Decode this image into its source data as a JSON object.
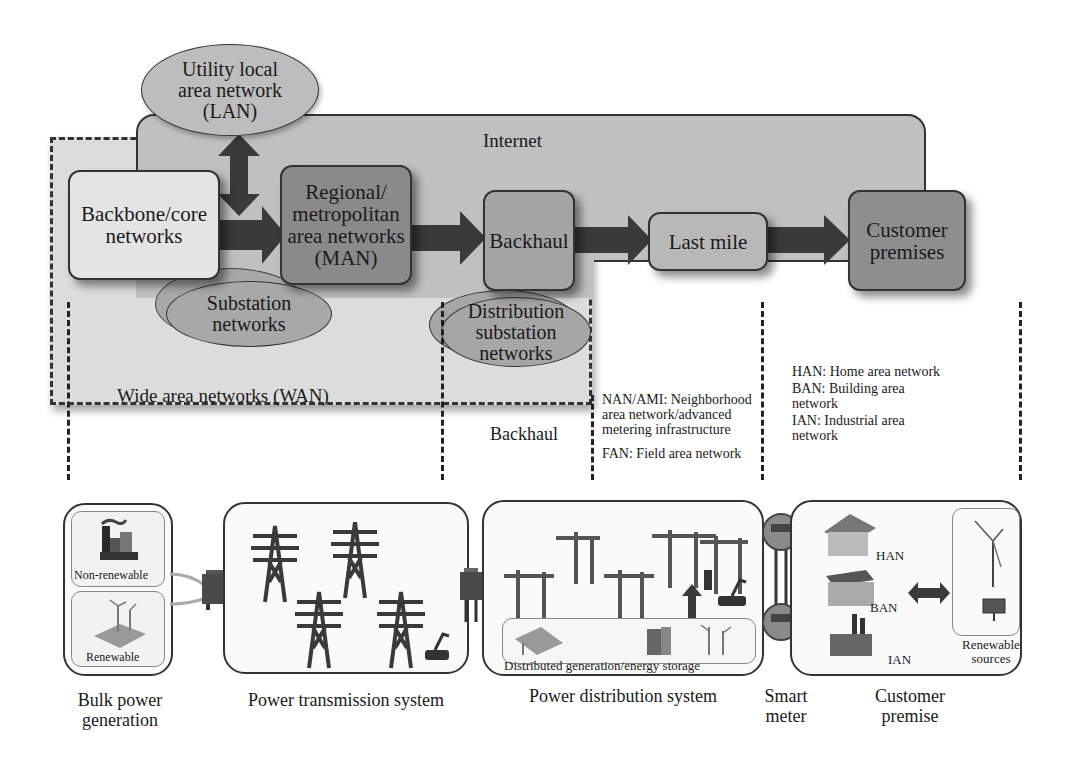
{
  "top": {
    "internet_label": "Internet",
    "wan_label": "Wide area networks (WAN)",
    "nodes": {
      "backbone": "Backbone/core networks",
      "man": "Regional/ metropolitan area networks (MAN)",
      "backhaul": "Backhaul",
      "last_mile": "Last mile",
      "customer": "Customer premises"
    },
    "ellipses": {
      "lan": "Utility local area network (LAN)",
      "substation": "Substation networks",
      "distribution": "Distribution substation networks"
    }
  },
  "middle": {
    "backhaul_label": "Backhaul",
    "nan_notes": [
      "NAN/AMI: Neighborhood area network/advanced metering infrastructure",
      "FAN: Field area network"
    ],
    "han_notes": [
      "HAN: Home area network",
      "BAN: Building area network",
      "IAN: Industrial area network"
    ]
  },
  "bottom": {
    "bulk": {
      "caption": "Bulk power generation",
      "non_renewable": "Non-renewable",
      "renewable": "Renewable"
    },
    "transmission": {
      "caption": "Power transmission system"
    },
    "distribution": {
      "caption": "Power distribution system",
      "storage_label": "Distributed generation/energy storage"
    },
    "smart_meter": {
      "caption": "Smart meter"
    },
    "customer": {
      "caption": "Customer premise",
      "han": "HAN",
      "ban": "BAN",
      "ian": "IAN",
      "renewable_sources": "Renewable sources"
    }
  },
  "colors": {
    "wan_fill": "#dcdcdc",
    "internet_fill": "#c0c0c0",
    "man_fill": "#8a8a8a",
    "arrow": "#3a3a3a"
  }
}
